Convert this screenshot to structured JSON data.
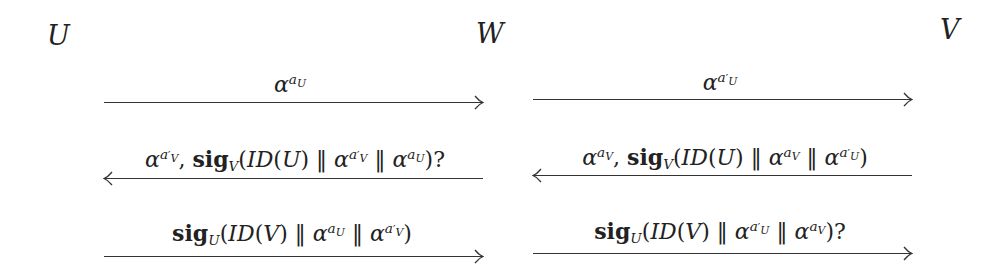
{
  "parties": [
    {
      "id": "U",
      "label": "U"
    },
    {
      "id": "W",
      "label": "W"
    },
    {
      "id": "V",
      "label": "V"
    }
  ],
  "messages": [
    {
      "row": 1,
      "segment": "U-W",
      "direction": "right",
      "text": "α^{a_U}"
    },
    {
      "row": 1,
      "segment": "W-V",
      "direction": "right",
      "text": "α^{a'_U}"
    },
    {
      "row": 2,
      "segment": "U-W",
      "direction": "left",
      "text": "α^{a'_V}, sig_V(ID(U) ‖ α^{a'_V} ‖ α^{a_U})?"
    },
    {
      "row": 2,
      "segment": "W-V",
      "direction": "left",
      "text": "α^{a_V}, sig_V(ID(U) ‖ α^{a_V} ‖ α^{a'_U})"
    },
    {
      "row": 3,
      "segment": "U-W",
      "direction": "right",
      "text": "sig_U(ID(V) ‖ α^{a_U} ‖ α^{a'_V})"
    },
    {
      "row": 3,
      "segment": "W-V",
      "direction": "right",
      "text": "sig_U(ID(V) ‖ α^{a'_U} ‖ α^{a_V})?"
    }
  ],
  "glyphs": {
    "alpha": "α",
    "a": "a",
    "prime": "′",
    "U": "U",
    "V": "V",
    "sig": "sig",
    "ID": "ID",
    "concat": "‖",
    "comma": ",",
    "q": "?",
    "lp": "(",
    "rp": ")"
  }
}
